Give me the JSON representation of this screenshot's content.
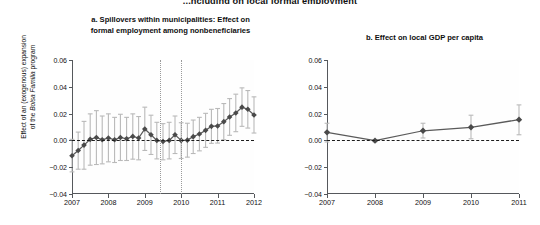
{
  "figure": {
    "master_title": "...ncluding on local formal employment",
    "background": "#ffffff",
    "marker_color": "#4a4a4a",
    "line_color": "#5a5a5a",
    "errorbar_color": "#b9b9b9",
    "zeroline_color": "#1c1c1c",
    "vline_color": "#9a9a9a",
    "axis_color": "#55585c"
  },
  "ylabel": {
    "line1": "Effect of an (exogenous) expansion",
    "line2_pre": "of the ",
    "line2_em": "Bolsa Familia",
    "line2_post": " program"
  },
  "chart_data": [
    {
      "type": "line",
      "panel": "a",
      "title": "a. Spillovers within municipalities: Effect on formal employment among nonbeneficiaries",
      "title_line1": "a. Spillovers within municipalities: Effect on",
      "title_line2": "formal employment among nonbeneficiaries",
      "xlabel": "",
      "ylabel": "Effect of an (exogenous) expansion of the Bolsa Familia program",
      "ylim": [
        -0.04,
        0.06
      ],
      "xlim": [
        2007.0,
        2012.0
      ],
      "yticks": [
        -0.04,
        -0.02,
        0.0,
        0.02,
        0.04,
        0.06
      ],
      "ytick_labels": [
        "−0.04",
        "−0.02",
        "0.00",
        "0.02",
        "0.04",
        "0.06"
      ],
      "xticks": [
        2007,
        2008,
        2009,
        2010,
        2011,
        2012
      ],
      "xtick_labels": [
        "2007",
        "2008",
        "2009",
        "2010",
        "2011",
        "2012"
      ],
      "grid": false,
      "legend": "none",
      "zero_reference_line": 0.0,
      "vertical_reference_lines": [
        2009.42,
        2010.0
      ],
      "x": [
        2007.0,
        2007.17,
        2007.33,
        2007.5,
        2007.67,
        2007.83,
        2008.0,
        2008.17,
        2008.33,
        2008.5,
        2008.67,
        2008.83,
        2009.0,
        2009.17,
        2009.33,
        2009.5,
        2009.67,
        2009.83,
        2010.0,
        2010.17,
        2010.33,
        2010.5,
        2010.67,
        2010.83,
        2011.0,
        2011.17,
        2011.33,
        2011.5,
        2011.67,
        2011.83,
        2012.0
      ],
      "values": [
        -0.0115,
        -0.0075,
        -0.0035,
        0.0008,
        0.0022,
        0.0005,
        0.0018,
        0.0005,
        0.0022,
        0.0012,
        0.003,
        0.0018,
        0.0085,
        0.0042,
        0.0,
        -0.0008,
        0.0,
        0.0042,
        0.0,
        0.0002,
        0.0028,
        0.0048,
        0.0075,
        0.0105,
        0.0108,
        0.014,
        0.0175,
        0.0205,
        0.0248,
        0.0232,
        0.019
      ],
      "ci_low": [
        -0.0235,
        -0.0215,
        -0.0215,
        -0.0185,
        -0.018,
        -0.0175,
        -0.016,
        -0.0165,
        -0.015,
        -0.015,
        -0.014,
        -0.0145,
        -0.0075,
        -0.0105,
        -0.0138,
        -0.0145,
        -0.0138,
        -0.0098,
        -0.0135,
        -0.0125,
        -0.0098,
        -0.0078,
        -0.0052,
        -0.0022,
        -0.002,
        0.0005,
        0.0038,
        0.0065,
        0.0105,
        0.0092,
        0.0055
      ],
      "ci_high": [
        0.0008,
        0.0062,
        0.0142,
        0.0198,
        0.0222,
        0.0182,
        0.0198,
        0.0172,
        0.0195,
        0.0172,
        0.0198,
        0.0178,
        0.0248,
        0.0188,
        0.0135,
        0.0125,
        0.0135,
        0.0182,
        0.0132,
        0.0128,
        0.0152,
        0.0172,
        0.0202,
        0.0232,
        0.0238,
        0.0275,
        0.0312,
        0.0345,
        0.0392,
        0.0372,
        0.0325
      ]
    },
    {
      "type": "line",
      "panel": "b",
      "title": "b. Effect on local GDP per capita",
      "title_line1": "b. Effect on local GDP per capita",
      "xlabel": "",
      "ylabel": "",
      "ylim": [
        -0.04,
        0.06
      ],
      "xlim": [
        2007.0,
        2011.0
      ],
      "yticks": [
        -0.04,
        -0.02,
        0.0,
        0.02,
        0.04,
        0.06
      ],
      "ytick_labels": [
        "−0.04",
        "−0.02",
        "0.00",
        "0.02",
        "0.04",
        "0.06"
      ],
      "xticks": [
        2007,
        2008,
        2009,
        2010,
        2011
      ],
      "xtick_labels": [
        "2007",
        "2008",
        "2009",
        "2010",
        "2011"
      ],
      "grid": false,
      "legend": "none",
      "zero_reference_line": 0.0,
      "vertical_reference_lines": [],
      "x": [
        2007,
        2008,
        2009,
        2010,
        2011
      ],
      "values": [
        0.006,
        -0.0002,
        0.0072,
        0.0098,
        0.0155
      ],
      "ci_low": [
        -0.0012,
        -0.001,
        0.0018,
        0.0012,
        0.0042
      ],
      "ci_high": [
        0.0128,
        0.0006,
        0.0128,
        0.0188,
        0.0265
      ]
    }
  ]
}
